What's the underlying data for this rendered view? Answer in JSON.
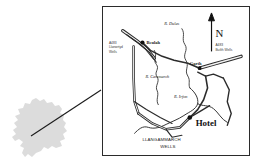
{
  "figure": {
    "type": "location-map"
  },
  "inset": {
    "name": "wales-outline",
    "description": "Wales silhouette",
    "fill_color": "#dcdcdc"
  },
  "leader_line": {
    "color": "#1a1a1a",
    "from": "wales-outline",
    "to": "map-frame"
  },
  "map": {
    "frame_color": "#2b2b2b",
    "background": "#ffffff",
    "compass": {
      "label": "N",
      "arrow": "north-arrow"
    },
    "places": [
      {
        "id": "beulah",
        "label": "Beulah",
        "marker": true
      },
      {
        "id": "garth",
        "label": "Garth",
        "marker": true
      },
      {
        "id": "hotel",
        "label": "Hotel",
        "marker": true
      }
    ],
    "town": {
      "line1": "LLANGAMMARCH",
      "line2": "WELLS"
    },
    "rivers": [
      {
        "id": "dulas",
        "label": "R. Dulas"
      },
      {
        "id": "cammarch",
        "label": "R. Cammarch"
      },
      {
        "id": "irfon",
        "label": "R. Irfon"
      }
    ],
    "roads": [
      {
        "id": "a483-llanwrtyd",
        "number": "A483",
        "dest_line1": "Llanwrtyd",
        "dest_line2": "Wells"
      },
      {
        "id": "a483-builth",
        "number": "A483",
        "dest_line1": "Builth Wells",
        "dest_line2": ""
      }
    ]
  }
}
